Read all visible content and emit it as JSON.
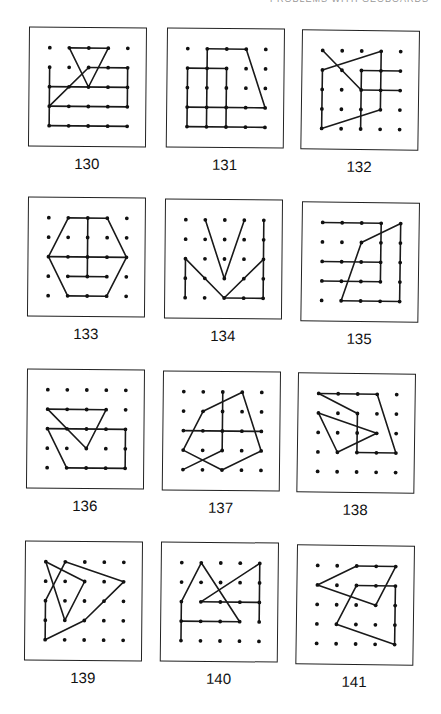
{
  "header": {
    "text": "PROBLEMS WITH GEOBOARDS"
  },
  "grid": {
    "cols": 5,
    "rows": 5
  },
  "panels": [
    {
      "label": "130",
      "x": 29,
      "y": 27,
      "rot": 0.5,
      "segments": [
        [
          [
            1,
            0
          ],
          [
            3,
            0
          ]
        ],
        [
          [
            3,
            0
          ],
          [
            2,
            2
          ]
        ],
        [
          [
            2,
            2
          ],
          [
            1,
            0
          ]
        ],
        [
          [
            0,
            1
          ],
          [
            0,
            4
          ]
        ],
        [
          [
            0,
            2
          ],
          [
            4,
            2
          ]
        ],
        [
          [
            0,
            4
          ],
          [
            4,
            4
          ]
        ],
        [
          [
            0,
            3
          ],
          [
            2,
            1
          ]
        ],
        [
          [
            2,
            1
          ],
          [
            4,
            1
          ]
        ],
        [
          [
            4,
            1
          ],
          [
            4,
            3
          ]
        ],
        [
          [
            0,
            3
          ],
          [
            4,
            3
          ]
        ]
      ]
    },
    {
      "label": "131",
      "x": 167,
      "y": 28,
      "rot": 0.6,
      "segments": [
        [
          [
            1,
            0
          ],
          [
            3,
            0
          ]
        ],
        [
          [
            3,
            0
          ],
          [
            4,
            3
          ]
        ],
        [
          [
            0,
            3
          ],
          [
            4,
            3
          ]
        ],
        [
          [
            0,
            1
          ],
          [
            2,
            1
          ]
        ],
        [
          [
            0,
            1
          ],
          [
            0,
            4
          ]
        ],
        [
          [
            1,
            0
          ],
          [
            1,
            4
          ]
        ],
        [
          [
            2,
            1
          ],
          [
            2,
            4
          ]
        ],
        [
          [
            0,
            4
          ],
          [
            4,
            4
          ]
        ]
      ]
    },
    {
      "label": "132",
      "x": 302,
      "y": 30,
      "rot": 0.8,
      "segments": [
        [
          [
            0,
            0
          ],
          [
            2,
            2
          ]
        ],
        [
          [
            0,
            1
          ],
          [
            3,
            0
          ]
        ],
        [
          [
            3,
            0
          ],
          [
            3,
            3
          ]
        ],
        [
          [
            3,
            3
          ],
          [
            0,
            4
          ]
        ],
        [
          [
            0,
            1
          ],
          [
            0,
            4
          ]
        ],
        [
          [
            2,
            1
          ],
          [
            4,
            1
          ]
        ],
        [
          [
            2,
            1
          ],
          [
            2,
            4
          ]
        ],
        [
          [
            2,
            2
          ],
          [
            4,
            2
          ]
        ]
      ]
    },
    {
      "label": "133",
      "x": 28,
      "y": 197,
      "rot": 0.5,
      "segments": [
        [
          [
            1,
            0
          ],
          [
            3,
            0
          ]
        ],
        [
          [
            3,
            0
          ],
          [
            4,
            2
          ]
        ],
        [
          [
            4,
            2
          ],
          [
            3,
            4
          ]
        ],
        [
          [
            3,
            4
          ],
          [
            1,
            4
          ]
        ],
        [
          [
            1,
            4
          ],
          [
            0,
            2
          ]
        ],
        [
          [
            0,
            2
          ],
          [
            1,
            0
          ]
        ],
        [
          [
            0,
            2
          ],
          [
            4,
            2
          ]
        ],
        [
          [
            2,
            0
          ],
          [
            2,
            3
          ]
        ],
        [
          [
            1,
            3
          ],
          [
            3,
            3
          ]
        ]
      ]
    },
    {
      "label": "134",
      "x": 165,
      "y": 199,
      "rot": 0.5,
      "segments": [
        [
          [
            1,
            0
          ],
          [
            2,
            3
          ]
        ],
        [
          [
            2,
            3
          ],
          [
            3,
            0
          ]
        ],
        [
          [
            0,
            2
          ],
          [
            0,
            4
          ]
        ],
        [
          [
            0,
            2
          ],
          [
            2,
            4
          ]
        ],
        [
          [
            2,
            4
          ],
          [
            4,
            2
          ]
        ],
        [
          [
            4,
            0
          ],
          [
            4,
            4
          ]
        ],
        [
          [
            2,
            4
          ],
          [
            4,
            4
          ]
        ]
      ]
    },
    {
      "label": "135",
      "x": 302,
      "y": 202,
      "rot": 0.8,
      "segments": [
        [
          [
            0,
            0
          ],
          [
            3,
            0
          ]
        ],
        [
          [
            3,
            0
          ],
          [
            3,
            3
          ]
        ],
        [
          [
            0,
            2
          ],
          [
            3,
            2
          ]
        ],
        [
          [
            0,
            3
          ],
          [
            3,
            3
          ]
        ],
        [
          [
            2,
            1
          ],
          [
            4,
            0
          ]
        ],
        [
          [
            4,
            0
          ],
          [
            4,
            4
          ]
        ],
        [
          [
            1,
            4
          ],
          [
            4,
            4
          ]
        ],
        [
          [
            1,
            4
          ],
          [
            2,
            1
          ]
        ]
      ]
    },
    {
      "label": "136",
      "x": 27,
      "y": 369,
      "rot": 0.5,
      "segments": [
        [
          [
            0,
            1
          ],
          [
            3,
            1
          ]
        ],
        [
          [
            3,
            1
          ],
          [
            2,
            3
          ]
        ],
        [
          [
            2,
            3
          ],
          [
            0,
            1
          ]
        ],
        [
          [
            0,
            2
          ],
          [
            4,
            2
          ]
        ],
        [
          [
            4,
            2
          ],
          [
            4,
            4
          ]
        ],
        [
          [
            4,
            4
          ],
          [
            1,
            4
          ]
        ],
        [
          [
            1,
            4
          ],
          [
            0,
            2
          ]
        ]
      ]
    },
    {
      "label": "137",
      "x": 163,
      "y": 371,
      "rot": 0.6,
      "segments": [
        [
          [
            1,
            1
          ],
          [
            3,
            0
          ]
        ],
        [
          [
            3,
            0
          ],
          [
            4,
            3
          ]
        ],
        [
          [
            4,
            3
          ],
          [
            2,
            4
          ]
        ],
        [
          [
            2,
            4
          ],
          [
            0,
            3
          ]
        ],
        [
          [
            0,
            3
          ],
          [
            1,
            1
          ]
        ],
        [
          [
            0,
            2
          ],
          [
            4,
            2
          ]
        ],
        [
          [
            2,
            0
          ],
          [
            2,
            3
          ]
        ],
        [
          [
            2,
            3
          ],
          [
            0,
            4
          ]
        ]
      ]
    },
    {
      "label": "138",
      "x": 298,
      "y": 373,
      "rot": 0.8,
      "segments": [
        [
          [
            0,
            0
          ],
          [
            3,
            0
          ]
        ],
        [
          [
            3,
            0
          ],
          [
            4,
            3
          ]
        ],
        [
          [
            4,
            3
          ],
          [
            2,
            3
          ]
        ],
        [
          [
            2,
            3
          ],
          [
            2,
            1
          ]
        ],
        [
          [
            2,
            1
          ],
          [
            0,
            0
          ]
        ],
        [
          [
            0,
            1
          ],
          [
            3,
            2
          ]
        ],
        [
          [
            3,
            2
          ],
          [
            1,
            3
          ]
        ],
        [
          [
            1,
            3
          ],
          [
            0,
            1
          ]
        ]
      ]
    },
    {
      "label": "139",
      "x": 25,
      "y": 541,
      "rot": 0.5,
      "segments": [
        [
          [
            0,
            0
          ],
          [
            2,
            1
          ]
        ],
        [
          [
            2,
            1
          ],
          [
            1,
            3
          ]
        ],
        [
          [
            1,
            3
          ],
          [
            0,
            0
          ]
        ],
        [
          [
            1,
            0
          ],
          [
            4,
            1
          ]
        ],
        [
          [
            4,
            1
          ],
          [
            2,
            3
          ]
        ],
        [
          [
            2,
            3
          ],
          [
            0,
            4
          ]
        ],
        [
          [
            0,
            4
          ],
          [
            0,
            2
          ]
        ],
        [
          [
            0,
            2
          ],
          [
            1,
            0
          ]
        ]
      ]
    },
    {
      "label": "140",
      "x": 161,
      "y": 542,
      "rot": 0.6,
      "segments": [
        [
          [
            1,
            0
          ],
          [
            3,
            3
          ]
        ],
        [
          [
            1,
            0
          ],
          [
            0,
            2
          ]
        ],
        [
          [
            0,
            2
          ],
          [
            0,
            4
          ]
        ],
        [
          [
            0,
            3
          ],
          [
            3,
            3
          ]
        ],
        [
          [
            1,
            2
          ],
          [
            4,
            0
          ]
        ],
        [
          [
            4,
            0
          ],
          [
            4,
            3
          ]
        ],
        [
          [
            1,
            2
          ],
          [
            4,
            2
          ]
        ]
      ]
    },
    {
      "label": "141",
      "x": 297,
      "y": 545,
      "rot": 0.8,
      "segments": [
        [
          [
            0,
            1
          ],
          [
            2,
            0
          ]
        ],
        [
          [
            2,
            0
          ],
          [
            4,
            0
          ]
        ],
        [
          [
            4,
            0
          ],
          [
            3,
            2
          ]
        ],
        [
          [
            3,
            2
          ],
          [
            0,
            1
          ]
        ],
        [
          [
            2,
            1
          ],
          [
            4,
            1
          ]
        ],
        [
          [
            4,
            1
          ],
          [
            4,
            4
          ]
        ],
        [
          [
            4,
            4
          ],
          [
            1,
            3
          ]
        ],
        [
          [
            1,
            3
          ],
          [
            2,
            1
          ]
        ]
      ]
    }
  ]
}
